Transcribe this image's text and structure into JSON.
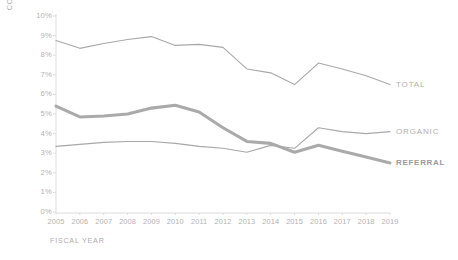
{
  "chart_data": {
    "type": "line",
    "title": "",
    "xlabel": "FISCAL YEAR",
    "ylabel": "CONVERSION RATE",
    "categories": [
      "2005",
      "2006",
      "2007",
      "2008",
      "2009",
      "2010",
      "2011",
      "2012",
      "2013",
      "2014",
      "2015",
      "2016",
      "2017",
      "2018",
      "2019"
    ],
    "x": [
      2005,
      2006,
      2007,
      2008,
      2009,
      2010,
      2011,
      2012,
      2013,
      2014,
      2015,
      2016,
      2017,
      2018,
      2019
    ],
    "ylim": [
      0,
      10
    ],
    "yticks": [
      "0%",
      "1%",
      "2%",
      "3%",
      "4%",
      "5%",
      "6%",
      "7%",
      "8%",
      "9%",
      "10%"
    ],
    "ytick_values": [
      0,
      1,
      2,
      3,
      4,
      5,
      6,
      7,
      8,
      9,
      10
    ],
    "grid": false,
    "legend_position": "right-inline",
    "series": [
      {
        "name": "TOTAL",
        "color": "#a8a8a8",
        "width": 1.1,
        "values": [
          8.75,
          8.35,
          8.6,
          8.8,
          8.95,
          8.5,
          8.55,
          8.4,
          7.3,
          7.1,
          6.5,
          7.6,
          7.3,
          6.95,
          6.5
        ]
      },
      {
        "name": "ORGANIC",
        "color": "#a8a8a8",
        "width": 1.1,
        "values": [
          3.35,
          3.45,
          3.55,
          3.6,
          3.6,
          3.5,
          3.35,
          3.25,
          3.05,
          3.4,
          3.25,
          4.3,
          4.1,
          4.0,
          4.1
        ]
      },
      {
        "name": "REFERRAL",
        "color": "#aaaaaa",
        "width": 3.1,
        "values": [
          5.4,
          4.85,
          4.9,
          5.0,
          5.3,
          5.45,
          5.1,
          4.3,
          3.6,
          3.5,
          3.05,
          3.4,
          3.1,
          2.8,
          2.5
        ]
      }
    ]
  },
  "axis": {
    "y_title": "CONVERSION RATE",
    "x_title": "FISCAL YEAR"
  },
  "legend": {
    "items": [
      {
        "label": "TOTAL",
        "bold": false
      },
      {
        "label": "ORGANIC",
        "bold": false
      },
      {
        "label": "REFERRAL",
        "bold": true
      }
    ]
  },
  "colors": {
    "line": "#a8a8a8",
    "axis": "#dcdcdc",
    "tick_text": "#b2b2b2",
    "title_text": "#adadad",
    "emphasis_text": "#9a9a9a",
    "background": "#ffffff"
  }
}
